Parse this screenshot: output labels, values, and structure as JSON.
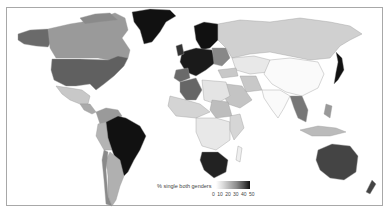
{
  "map": {
    "type": "choropleth",
    "projection": "world",
    "legend": {
      "title": "% single both genders",
      "ticks": [
        "0",
        "10",
        "20",
        "30",
        "40",
        "50"
      ],
      "range": [
        0,
        50
      ],
      "color_low": "#ffffff",
      "color_high": "#111111"
    },
    "regions": [
      {
        "name": "Greenland",
        "shade": "very dark"
      },
      {
        "name": "Alaska",
        "shade": "medium-dark"
      },
      {
        "name": "Canada",
        "shade": "medium"
      },
      {
        "name": "United States",
        "shade": "medium-dark"
      },
      {
        "name": "Mexico",
        "shade": "light"
      },
      {
        "name": "Brazil",
        "shade": "very dark"
      },
      {
        "name": "Argentina",
        "shade": "medium-light"
      },
      {
        "name": "Chile",
        "shade": "medium"
      },
      {
        "name": "Peru",
        "shade": "medium-light"
      },
      {
        "name": "Northern Europe",
        "shade": "very dark"
      },
      {
        "name": "Western Europe",
        "shade": "very dark"
      },
      {
        "name": "Spain",
        "shade": "medium-dark"
      },
      {
        "name": "Russia",
        "shade": "light"
      },
      {
        "name": "China",
        "shade": "white"
      },
      {
        "name": "Japan",
        "shade": "very dark"
      },
      {
        "name": "India",
        "shade": "white"
      },
      {
        "name": "Algeria",
        "shade": "medium-dark"
      },
      {
        "name": "South Africa",
        "shade": "very dark"
      },
      {
        "name": "Australia",
        "shade": "dark"
      },
      {
        "name": "New Zealand",
        "shade": "dark"
      },
      {
        "name": "Thailand",
        "shade": "medium-dark"
      }
    ]
  }
}
